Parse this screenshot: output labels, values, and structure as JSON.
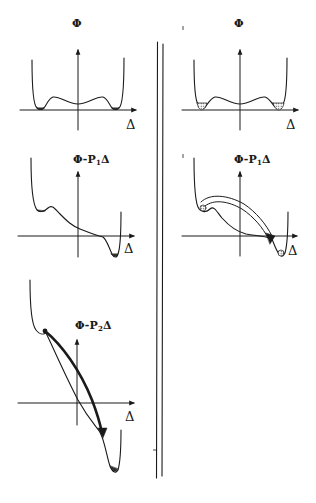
{
  "figure": {
    "type": "schematic potential-energy diagram",
    "ink_color": "#1a1a1a",
    "background": "#ffffff",
    "divider": {
      "style": "double vertical line",
      "separates": [
        "left column",
        "right column"
      ]
    },
    "panels": [
      {
        "id": "top-left",
        "y_label": "Φ",
        "x_label": "Δ",
        "description": "symmetric double-well potential with small minima at both ends and a shallow central dip",
        "wells_hatched": false
      },
      {
        "id": "top-right",
        "y_label": "Φ",
        "x_label": "Δ",
        "description": "same symmetric double-well potential with hatched (populated) wells",
        "wells_hatched": true
      },
      {
        "id": "middle-left",
        "y_label": {
          "base": "Φ-P",
          "sub": "1",
          "tail": "Δ"
        },
        "x_label": "Δ",
        "description": "tilted potential under field P1: shallow left well, deep right well"
      },
      {
        "id": "middle-right",
        "y_label": {
          "base": "Φ-P",
          "sub": "1",
          "tail": "Δ"
        },
        "x_label": "Δ",
        "description": "tilted potential with curved arrow indicating transition from left well over the barrier to right well"
      },
      {
        "id": "bottom-left",
        "y_label": {
          "base": "Φ-P",
          "sub": "2",
          "tail": "Δ"
        },
        "x_label": "Δ",
        "description": "strongly tilted potential under field P2: left well vanishes, bold arrow from start point down the slope to deep right minimum"
      }
    ]
  }
}
